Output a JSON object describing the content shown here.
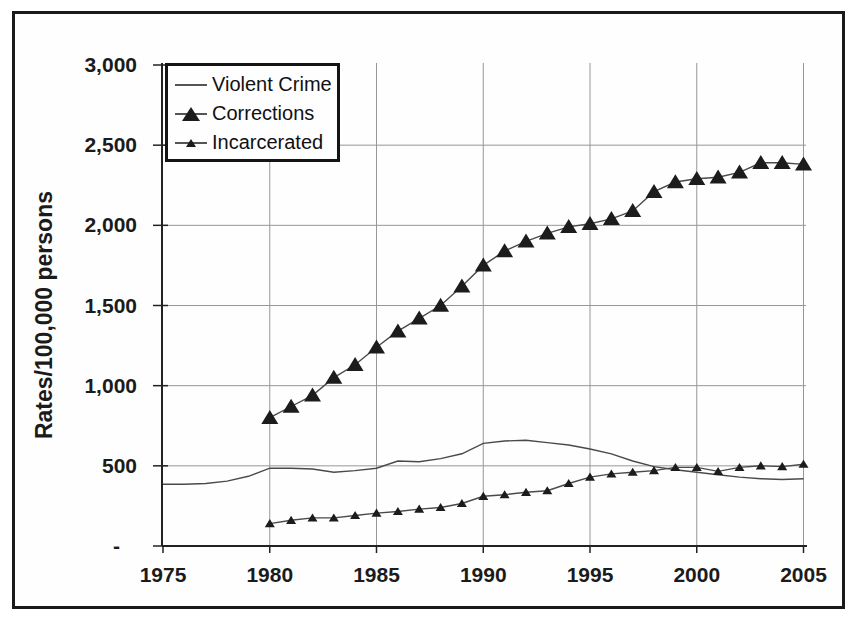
{
  "colors": {
    "grid": "#979797",
    "axis": "#222222",
    "line": "#4a4a4a",
    "marker": "#1c1c1c",
    "frame": "#1a1a1a"
  },
  "chart_data": {
    "type": "line",
    "title": "",
    "xlabel": "",
    "ylabel": "Rates/100,000 persons",
    "x_range": [
      1975,
      2005
    ],
    "y_range": [
      0,
      3000
    ],
    "grid": true,
    "legend_position": "top-left",
    "y_ticks": [
      {
        "label": "3,000",
        "value": 3000
      },
      {
        "label": "2,500",
        "value": 2500
      },
      {
        "label": "2,000",
        "value": 2000
      },
      {
        "label": "1,500",
        "value": 1500
      },
      {
        "label": "1,000",
        "value": 1000
      },
      {
        "label": "500",
        "value": 500
      },
      {
        "label": "-",
        "value": 0
      }
    ],
    "x_ticks": [
      "1975",
      "1980",
      "1985",
      "1990",
      "1995",
      "2000",
      "2005"
    ],
    "series": [
      {
        "name": "Violent Crime",
        "marker": "none",
        "year_start": 1975,
        "values": [
          385,
          385,
          390,
          405,
          435,
          485,
          485,
          480,
          460,
          470,
          485,
          530,
          525,
          545,
          575,
          640,
          655,
          660,
          645,
          630,
          605,
          575,
          530,
          495,
          475,
          460,
          445,
          430,
          420,
          415,
          420
        ]
      },
      {
        "name": "Corrections",
        "marker": "triangle-large",
        "year_start": 1980,
        "values": [
          800,
          870,
          940,
          1050,
          1130,
          1240,
          1340,
          1420,
          1500,
          1620,
          1750,
          1840,
          1900,
          1950,
          1990,
          2010,
          2040,
          2090,
          2210,
          2270,
          2290,
          2300,
          2330,
          2390,
          2390,
          2380
        ]
      },
      {
        "name": "Incarcerated",
        "marker": "triangle-small",
        "year_start": 1980,
        "values": [
          140,
          160,
          175,
          175,
          190,
          205,
          215,
          230,
          240,
          265,
          310,
          320,
          335,
          345,
          390,
          430,
          450,
          460,
          470,
          490,
          490,
          465,
          490,
          500,
          495,
          510
        ]
      }
    ]
  }
}
